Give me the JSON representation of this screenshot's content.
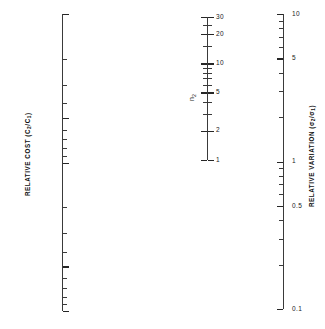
{
  "figure": {
    "type": "nomogram",
    "background": "#ffffff",
    "ink_color": "#2b2b2b",
    "width": 325,
    "height": 329
  },
  "chart_data": {
    "type": "line",
    "title": "",
    "subtitle": "",
    "xlabel": "",
    "ylabel": "",
    "grid": false,
    "legend": "none",
    "axes": [
      {
        "id": "relative-cost",
        "title": "RELATIVE COST (C2/C1)",
        "title_display": "RELATIVE COST (C",
        "title_sub1": "2",
        "title_mid": "/C",
        "title_sub2": "1",
        "title_end": ")",
        "scale": "log",
        "orientation": "vertical",
        "direction": "top-to-bottom-increasing",
        "range": [
          0.1,
          10
        ],
        "top_value": 0.1,
        "bottom_value": 10,
        "labeled_ticks": [
          "0.1",
          "0.5",
          "1",
          "5",
          "10"
        ],
        "labeled_values": [
          0.1,
          0.5,
          1,
          5,
          10
        ],
        "minor_values": [
          0.2,
          0.3,
          0.4,
          0.6,
          0.7,
          0.8,
          0.9,
          2,
          3,
          4,
          6,
          7,
          8,
          9
        ],
        "tick_side": "right",
        "label_side": "left",
        "x_px": 62,
        "y_top_px": 14,
        "y_bottom_px": 311
      },
      {
        "id": "n2",
        "title": "n2",
        "title_display": "n",
        "title_sub1": "2",
        "scale": "log",
        "orientation": "vertical",
        "direction": "top-to-bottom-decreasing",
        "range": [
          1,
          30
        ],
        "top_value": 30,
        "bottom_value": 1,
        "labeled_ticks": [
          "30",
          "20",
          "10",
          "5",
          "2",
          "1"
        ],
        "labeled_values": [
          30,
          20,
          10,
          5,
          2,
          1
        ],
        "minor_values": [
          25,
          15,
          9,
          8,
          7,
          6,
          4,
          3
        ],
        "tick_side": "both",
        "label_side": "right",
        "x_px": 207,
        "y_top_px": 17,
        "y_bottom_px": 160
      },
      {
        "id": "relative-variation",
        "title": "RELATIVE VARIATION (o2/o1)",
        "title_display": "RELATIVE VARIATION (σ",
        "title_sub1": "2",
        "title_mid": "/σ",
        "title_sub2": "1",
        "title_end": ")",
        "scale": "log",
        "orientation": "vertical",
        "direction": "top-to-bottom-decreasing",
        "range": [
          0.1,
          10
        ],
        "top_value": 10,
        "bottom_value": 0.1,
        "labeled_ticks": [
          "10",
          "5",
          "1",
          "0.5",
          "0.1"
        ],
        "labeled_values": [
          10,
          5,
          1,
          0.5,
          0.1
        ],
        "minor_values": [
          9,
          8,
          7,
          6,
          4,
          3,
          2,
          0.9,
          0.8,
          0.7,
          0.6,
          0.4,
          0.3,
          0.2
        ],
        "tick_side": "left",
        "label_side": "right",
        "x_px": 283,
        "y_top_px": 14,
        "y_bottom_px": 309
      }
    ]
  }
}
